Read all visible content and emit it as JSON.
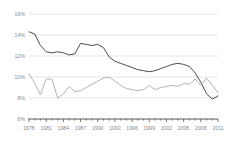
{
  "chart_data": {
    "type": "line",
    "title": "",
    "subtitle": "",
    "xlabel": "",
    "ylabel": "",
    "grid": true,
    "legend_position": "none",
    "xlim": [
      1978,
      2011
    ],
    "ylim": [
      6,
      16
    ],
    "ytick_labels": [
      "16%",
      "14%",
      "12%",
      "10%",
      "8%",
      "6%"
    ],
    "ytick_values": [
      16,
      14,
      12,
      10,
      8,
      6
    ],
    "xtick_labels": [
      "1978",
      "1981",
      "1984",
      "1987",
      "1990",
      "1993",
      "1996",
      "1999",
      "2002",
      "2005",
      "2008",
      "2011"
    ],
    "xtick_values": [
      1978,
      1981,
      1984,
      1987,
      1990,
      1993,
      1996,
      1999,
      2002,
      2005,
      2008,
      2011
    ],
    "x": [
      1978,
      1979,
      1980,
      1981,
      1982,
      1983,
      1984,
      1985,
      1986,
      1987,
      1988,
      1989,
      1990,
      1991,
      1992,
      1993,
      1994,
      1995,
      1996,
      1997,
      1998,
      1999,
      2000,
      2001,
      2002,
      2003,
      2004,
      2005,
      2006,
      2007,
      2008,
      2009,
      2010,
      2011
    ],
    "series": [
      {
        "name": "series-dark",
        "color": "#4d4d4d",
        "values": [
          14.3,
          14.1,
          13.0,
          12.4,
          12.3,
          12.4,
          12.3,
          12.1,
          12.2,
          13.2,
          13.1,
          13.0,
          13.1,
          12.8,
          11.9,
          11.5,
          11.3,
          11.1,
          10.9,
          10.7,
          10.6,
          10.5,
          10.6,
          10.8,
          11.0,
          11.2,
          11.3,
          11.2,
          11.0,
          10.4,
          9.5,
          8.4,
          7.9,
          8.2
        ]
      },
      {
        "name": "series-light",
        "color": "#b3b3b3",
        "values": [
          10.3,
          9.4,
          8.3,
          9.8,
          9.8,
          8.0,
          8.4,
          9.1,
          8.6,
          8.7,
          9.0,
          9.3,
          9.6,
          9.9,
          10.0,
          9.6,
          9.2,
          8.9,
          8.8,
          8.7,
          8.8,
          9.2,
          8.8,
          9.0,
          9.1,
          9.2,
          9.1,
          9.4,
          9.3,
          9.8,
          9.2,
          9.9,
          9.2,
          8.5
        ]
      }
    ],
    "colors": {
      "grid": "#d8d8d8",
      "axis": "#555555",
      "tick_text": "#8a8a8a",
      "background": "#ffffff"
    }
  }
}
